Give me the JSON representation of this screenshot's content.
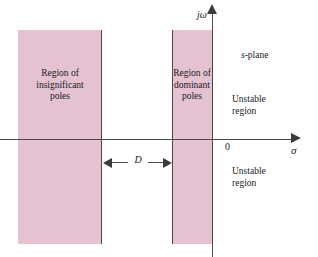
{
  "figure": {
    "kind": "s-plane-pole-region-diagram",
    "plane_label": {
      "italic_part": "s",
      "rest": "-plane"
    },
    "axes": {
      "vertical_label": "jω",
      "horizontal_label": "σ",
      "origin_label": "0"
    },
    "regions": [
      {
        "name": "insignificant-poles",
        "label_lines": [
          "Region of",
          "insignificant",
          "poles"
        ],
        "fill": "#e5c2d2"
      },
      {
        "name": "dominant-poles",
        "label_lines": [
          "Region of",
          "dominant",
          "poles"
        ],
        "fill": "#e5c2d2"
      }
    ],
    "unstable_regions": [
      {
        "position": "upper-right",
        "label_lines": [
          "Unstable",
          "region"
        ]
      },
      {
        "position": "lower-right",
        "label_lines": [
          "Unstable",
          "region"
        ]
      }
    ],
    "dimension": {
      "label": "D",
      "description": "separation between dominant and insignificant pole regions"
    },
    "colors": {
      "region_fill": "#e5c2d2",
      "axis": "#4a4a4a",
      "region_border": "#55464b",
      "background": "#ffffff",
      "text": "#1a1a1a"
    }
  }
}
